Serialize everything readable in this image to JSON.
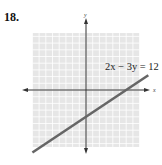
{
  "problem": {
    "number": "18."
  },
  "chart_data": {
    "type": "line",
    "title": "",
    "xlabel": "x",
    "ylabel": "y",
    "xlim": [
      -8,
      8
    ],
    "ylim": [
      -8.5,
      8.5
    ],
    "grid": true,
    "grid_step": 1,
    "series": [
      {
        "name": "2x − 3y = 12",
        "equation": "2x − 3y = 12",
        "x": [
          -8,
          9.3
        ],
        "y": [
          -9.33,
          2.2
        ]
      }
    ],
    "annotations": [
      {
        "text": "2x − 3y = 12",
        "x": 3.5,
        "y": 3.5
      }
    ],
    "intercepts": {
      "x_intercept": 6,
      "y_intercept": -4
    },
    "colors": {
      "grid_background": "#e6e6e6",
      "grid_lines": "#ffffff",
      "axes": "#333333",
      "line": "#666666"
    }
  }
}
